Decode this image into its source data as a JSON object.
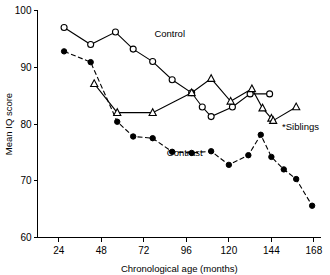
{
  "chart_data": {
    "type": "line",
    "title": "",
    "xlabel": "Chronological age (months)",
    "ylabel": "Mean IQ score",
    "xlim": [
      12,
      172
    ],
    "ylim": [
      60,
      100
    ],
    "xticks": [
      24,
      48,
      72,
      96,
      120,
      144,
      168
    ],
    "yticks": [
      60,
      70,
      80,
      90,
      100
    ],
    "grid": false,
    "legend_position": "inline-annotations",
    "series": [
      {
        "name": "Control",
        "marker": "open-circle",
        "linestyle": "solid",
        "label": "Control",
        "label_x": 78,
        "label_y": 95.4,
        "points": [
          {
            "x": 27,
            "y": 97.0
          },
          {
            "x": 42,
            "y": 94.0
          },
          {
            "x": 56,
            "y": 96.2
          },
          {
            "x": 66,
            "y": 93.2
          },
          {
            "x": 77,
            "y": 91.0
          },
          {
            "x": 88,
            "y": 87.8
          },
          {
            "x": 99,
            "y": 85.5
          },
          {
            "x": 105,
            "y": 83.0
          },
          {
            "x": 110,
            "y": 81.3
          },
          {
            "x": 122,
            "y": 83.0
          },
          {
            "x": 132,
            "y": 85.3
          },
          {
            "x": 143,
            "y": 85.3
          }
        ]
      },
      {
        "name": "Contrast",
        "marker": "filled-circle",
        "linestyle": "dashed",
        "label": "Contrast",
        "label_x": 85,
        "label_y": 74.4,
        "points": [
          {
            "x": 27,
            "y": 92.8
          },
          {
            "x": 42,
            "y": 90.9
          },
          {
            "x": 57,
            "y": 80.4
          },
          {
            "x": 66,
            "y": 77.8
          },
          {
            "x": 77,
            "y": 77.5
          },
          {
            "x": 88,
            "y": 75.1
          },
          {
            "x": 99,
            "y": 74.9
          },
          {
            "x": 110,
            "y": 75.2
          },
          {
            "x": 120,
            "y": 72.8
          },
          {
            "x": 131,
            "y": 74.5
          },
          {
            "x": 138,
            "y": 78.1
          },
          {
            "x": 144,
            "y": 74.2
          },
          {
            "x": 151,
            "y": 72.0
          },
          {
            "x": 158,
            "y": 70.3
          },
          {
            "x": 167,
            "y": 65.6
          }
        ]
      },
      {
        "name": "Siblings",
        "marker": "open-triangle",
        "linestyle": "solid",
        "label": "*Siblings",
        "label_x": 150,
        "label_y": 79.0,
        "points": [
          {
            "x": 44,
            "y": 87.1
          },
          {
            "x": 57,
            "y": 82.0
          },
          {
            "x": 77,
            "y": 82.0
          },
          {
            "x": 99,
            "y": 85.5
          },
          {
            "x": 110,
            "y": 88.0
          },
          {
            "x": 121,
            "y": 84.0
          },
          {
            "x": 133,
            "y": 86.2
          },
          {
            "x": 139,
            "y": 82.8
          },
          {
            "x": 144,
            "y": 81.0
          },
          {
            "x": 145,
            "y": 80.6
          },
          {
            "x": 158,
            "y": 83.0
          }
        ]
      }
    ]
  }
}
